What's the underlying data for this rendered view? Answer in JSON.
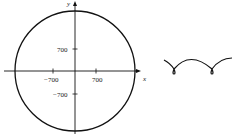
{
  "left_figure": {
    "type": "circle-on-axes",
    "x_axis_label": "x",
    "y_axis_label": "y",
    "x_ticks": [
      "−700",
      "700"
    ],
    "y_ticks": [
      "700",
      "−700"
    ]
  },
  "right_figure": {
    "type": "curve-sketch",
    "description": "cycloid-like arcs with small loops"
  }
}
